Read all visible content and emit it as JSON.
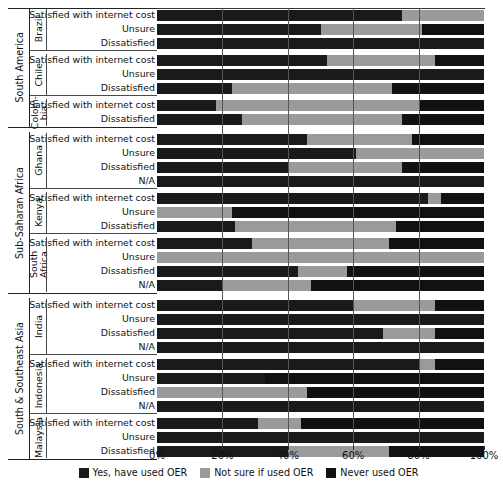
{
  "chart_data": {
    "type": "bar",
    "orientation": "horizontal",
    "stacked": true,
    "normalized": true,
    "title": "",
    "xlabel": "",
    "ylabel": "",
    "xlim": [
      0,
      100
    ],
    "xticks": [
      "0%",
      "20%",
      "40%",
      "60%",
      "80%",
      "100%"
    ],
    "xtick_values": [
      0,
      20,
      40,
      60,
      80,
      100
    ],
    "grid": true,
    "legend_position": "bottom",
    "series": [
      {
        "name": "Yes, have used OER",
        "color": "#1a1a1a"
      },
      {
        "name": "Not sure if used OER",
        "color": "#9a9a9a"
      },
      {
        "name": "Never used OER",
        "color": "#111111"
      }
    ],
    "regions": [
      {
        "name": "South America",
        "countries": [
          {
            "name": "Brazil",
            "rows": [
              {
                "label": "Satisfied with internet cost",
                "values": [
                  75,
                  25,
                  0
                ]
              },
              {
                "label": "Unsure",
                "values": [
                  50,
                  31,
                  19
                ]
              },
              {
                "label": "Dissatisfied",
                "values": [
                  100,
                  0,
                  0
                ]
              }
            ]
          },
          {
            "name": "Chile",
            "rows": [
              {
                "label": "Satisfied with internet cost",
                "values": [
                  52,
                  33,
                  15
                ]
              },
              {
                "label": "Unsure",
                "values": [
                  100,
                  0,
                  0
                ]
              },
              {
                "label": "Dissatisfied",
                "values": [
                  23,
                  49,
                  28
                ]
              }
            ]
          },
          {
            "name": "Colom-\nbia",
            "rows": [
              {
                "label": "Satisfied with internet cost",
                "values": [
                  18,
                  62,
                  20
                ]
              },
              {
                "label": "Dissatisfied",
                "values": [
                  26,
                  49,
                  25
                ]
              }
            ]
          }
        ]
      },
      {
        "name": "Sub-Saharan Africa",
        "countries": [
          {
            "name": "Ghana",
            "rows": [
              {
                "label": "Satisfied with internet cost",
                "values": [
                  46,
                  32,
                  22
                ]
              },
              {
                "label": "Unsure",
                "values": [
                  61,
                  39,
                  0
                ]
              },
              {
                "label": "Dissatisfied",
                "values": [
                  40,
                  35,
                  25
                ]
              },
              {
                "label": "N/A",
                "values": [
                  100,
                  0,
                  0
                ]
              }
            ]
          },
          {
            "name": "Kenya",
            "rows": [
              {
                "label": "Satisfied with internet cost",
                "values": [
                  83,
                  4,
                  13
                ]
              },
              {
                "label": "Unsure",
                "values": [
                  0,
                  23,
                  77
                ]
              },
              {
                "label": "Dissatisfied",
                "values": [
                  24,
                  49,
                  27
                ]
              }
            ]
          },
          {
            "name": "South Africa",
            "rows": [
              {
                "label": "Satisfied with internet cost",
                "values": [
                  29,
                  42,
                  29
                ]
              },
              {
                "label": "Unsure",
                "values": [
                  0,
                  100,
                  0
                ]
              },
              {
                "label": "Dissatisfied",
                "values": [
                  43,
                  15,
                  42
                ]
              },
              {
                "label": "N/A",
                "values": [
                  20,
                  27,
                  53
                ]
              }
            ]
          }
        ]
      },
      {
        "name": "South & Southeast Asia",
        "countries": [
          {
            "name": "India",
            "rows": [
              {
                "label": "Satisfied with internet cost",
                "values": [
                  60,
                  25,
                  15
                ]
              },
              {
                "label": "Unsure",
                "values": [
                  100,
                  0,
                  0
                ]
              },
              {
                "label": "Dissatisfied",
                "values": [
                  69,
                  16,
                  15
                ]
              },
              {
                "label": "N/A",
                "values": [
                  100,
                  0,
                  0
                ]
              }
            ]
          },
          {
            "name": "Indonesia",
            "rows": [
              {
                "label": "Satisfied with internet cost",
                "values": [
                  80,
                  5,
                  15
                ]
              },
              {
                "label": "Unsure",
                "values": [
                  33,
                  0,
                  67
                ]
              },
              {
                "label": "Dissatisfied",
                "values": [
                  0,
                  46,
                  54
                ]
              },
              {
                "label": "N/A",
                "values": [
                  100,
                  0,
                  0
                ]
              }
            ]
          },
          {
            "name": "Malaysia",
            "rows": [
              {
                "label": "Satisfied with internet cost",
                "values": [
                  31,
                  13,
                  56
                ]
              },
              {
                "label": "Unsure",
                "values": [
                  100,
                  0,
                  0
                ]
              },
              {
                "label": "Dissatisfied",
                "values": [
                  40,
                  31,
                  29
                ]
              }
            ]
          }
        ]
      }
    ]
  }
}
